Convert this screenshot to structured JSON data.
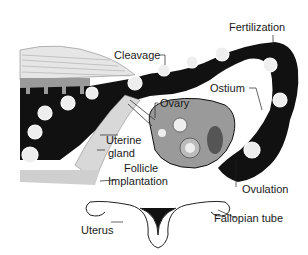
{
  "diagram": {
    "labels": {
      "cleavage": "Cleavage",
      "fertilization": "Fertilization",
      "ostium": "Ostium",
      "ovary": "Ovary",
      "uterine_gland_line1": "Uterine",
      "uterine_gland_line2": "gland",
      "follicle": "Follicle",
      "implantation": "Implantation",
      "ovulation": "Ovulation",
      "uterus": "Uterus",
      "fallopian_tube": "Fallopian tube"
    },
    "colors": {
      "ink": "#111111",
      "tissue_gray": "#9a9a9a",
      "light_gray": "#cfcfcf",
      "background": "#ffffff"
    }
  }
}
